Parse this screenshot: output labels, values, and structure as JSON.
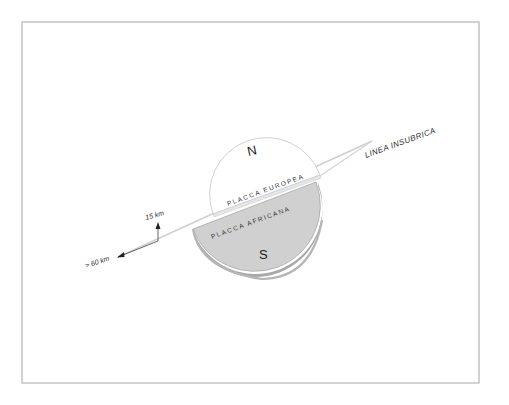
{
  "diagram": {
    "title": "",
    "labels": {
      "north": "N",
      "south": "S",
      "european_plate": "PLACCA EUROPEA",
      "african_plate": "PLACCA AFRICANA",
      "fault_line": "LINEA INSUBRICA",
      "vertical_scale": "15 km",
      "horizontal_scale": "> 60 km"
    },
    "colors": {
      "background": "#ffffff",
      "frame": "#b0b0b0",
      "european_plate_fill": "#ffffff",
      "african_plate_fill": "#cfcfcf",
      "african_plate_edge": "#a8a8a8",
      "fault_line": "#c8c8c8",
      "arrows": "#555555",
      "text": "#333333"
    }
  }
}
